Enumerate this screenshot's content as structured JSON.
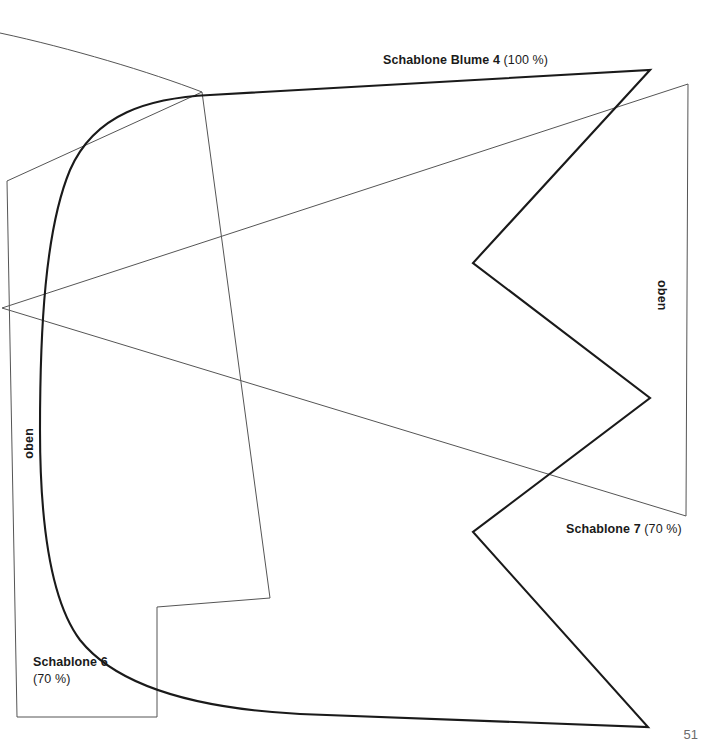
{
  "page": {
    "number": "51",
    "width": 712,
    "height": 755,
    "background": "#ffffff",
    "ink_thick": "#1a1a1a",
    "ink_thin": "#555555"
  },
  "labels": {
    "blume4": {
      "name": "Schablone Blume 4",
      "scale": "(100 %)"
    },
    "schablone7": {
      "name": "Schablone 7",
      "scale": "(70 %)"
    },
    "schablone6": {
      "name": "Schablone 6",
      "scale": "(70 %)"
    },
    "oben_left": "oben",
    "oben_right": "oben"
  },
  "shapes": {
    "blume4": {
      "label": "Schablone Blume 4",
      "stroke": "#1a1a1a",
      "stroke_width": 2.1,
      "path": "M 650 70 L 473 263 L 650 398 L 473 532 L 648 727 L 300 714 C 205 709 120 690 80 640 C 50 600 40 520 40 430 C 40 330 45 230 70 170 C 95 113 150 98 210 95 L 650 70 Z"
    },
    "schablone7": {
      "label": "Schablone 7",
      "stroke": "#555555",
      "stroke_width": 1.0,
      "path": "M 2 308 L 688 84 L 686 516 L 2 308 Z"
    },
    "schablone6": {
      "label": "Schablone 6",
      "stroke": "#555555",
      "stroke_width": 1.0,
      "path": "M 7 181 L 17 717 L 157 717 L 157 607 L 270 598 L 202 92 Z"
    },
    "guide_arc_top": {
      "label": "guide-arc-top",
      "stroke": "#555555",
      "stroke_width": 1.0,
      "path": "M 0 33 C 70 48 150 72 202 92"
    }
  }
}
